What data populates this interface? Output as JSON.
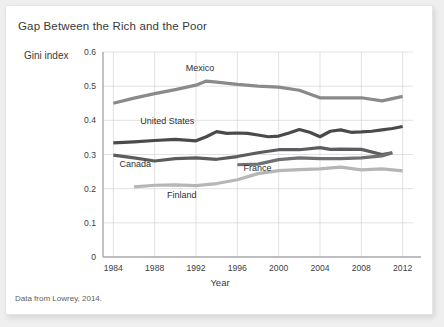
{
  "figure": {
    "title": "Gap Between the Rich and the Poor",
    "source_note": "Data from Lowrey, 2014."
  },
  "chart_data": {
    "type": "line",
    "title": "Gap Between the Rich and the Poor",
    "xlabel": "Year",
    "ylabel": "Gini index",
    "xlim": [
      1983,
      2013
    ],
    "ylim": [
      0,
      0.6
    ],
    "xticks": [
      "1984",
      "1988",
      "1992",
      "1996",
      "2000",
      "2004",
      "2008",
      "2012"
    ],
    "yticks": [
      "0",
      "0.1",
      "0.2",
      "0.3",
      "0.4",
      "0.5",
      "0.6"
    ],
    "grid": true,
    "legend": "inline-labels",
    "series": [
      {
        "name": "Mexico",
        "color": "#8a8a8c",
        "label_x": 1991.0,
        "label_y": 0.545,
        "x": [
          1984,
          1986,
          1988,
          1990,
          1992,
          1993,
          1994,
          1996,
          1998,
          2000,
          2002,
          2004,
          2006,
          2008,
          2010,
          2012
        ],
        "y": [
          0.45,
          0.465,
          0.478,
          0.49,
          0.503,
          0.515,
          0.512,
          0.505,
          0.5,
          0.497,
          0.488,
          0.466,
          0.466,
          0.466,
          0.457,
          0.47
        ]
      },
      {
        "name": "United States",
        "color": "#4a4a4c",
        "label_x": 1986.6,
        "label_y": 0.388,
        "x": [
          1984,
          1986,
          1988,
          1990,
          1992,
          1993,
          1994,
          1995,
          1996,
          1997,
          1998,
          1999,
          2000,
          2001,
          2002,
          2003,
          2004,
          2005,
          2006,
          2007,
          2008,
          2009,
          2010,
          2011,
          2012
        ],
        "y": [
          0.334,
          0.337,
          0.341,
          0.344,
          0.34,
          0.352,
          0.367,
          0.362,
          0.363,
          0.362,
          0.357,
          0.352,
          0.354,
          0.363,
          0.373,
          0.365,
          0.352,
          0.368,
          0.372,
          0.365,
          0.366,
          0.368,
          0.372,
          0.376,
          0.382
        ]
      },
      {
        "name": "Canada",
        "color": "#5c5c5e",
        "label_x": 1984.6,
        "label_y": 0.262,
        "x": [
          1984,
          1986,
          1988,
          1990,
          1992,
          1994,
          1996,
          1998,
          2000,
          2002,
          2004,
          2005,
          2006,
          2008,
          2010,
          2011
        ],
        "y": [
          0.298,
          0.29,
          0.281,
          0.288,
          0.29,
          0.286,
          0.294,
          0.305,
          0.314,
          0.314,
          0.32,
          0.315,
          0.316,
          0.315,
          0.3,
          0.305
        ]
      },
      {
        "name": "France",
        "color": "#707072",
        "label_x": 1996.6,
        "label_y": 0.252,
        "x": [
          1996,
          1998,
          2000,
          2002,
          2004,
          2006,
          2008,
          2010,
          2011
        ],
        "y": [
          0.27,
          0.272,
          0.285,
          0.29,
          0.288,
          0.288,
          0.29,
          0.296,
          0.305
        ]
      },
      {
        "name": "Finland",
        "color": "#b6b6b8",
        "label_x": 1989.2,
        "label_y": 0.174,
        "x": [
          1986,
          1988,
          1990,
          1992,
          1994,
          1996,
          1998,
          2000,
          2002,
          2004,
          2006,
          2008,
          2010,
          2012
        ],
        "y": [
          0.205,
          0.21,
          0.211,
          0.209,
          0.215,
          0.226,
          0.244,
          0.253,
          0.256,
          0.258,
          0.263,
          0.255,
          0.258,
          0.252
        ]
      }
    ]
  }
}
